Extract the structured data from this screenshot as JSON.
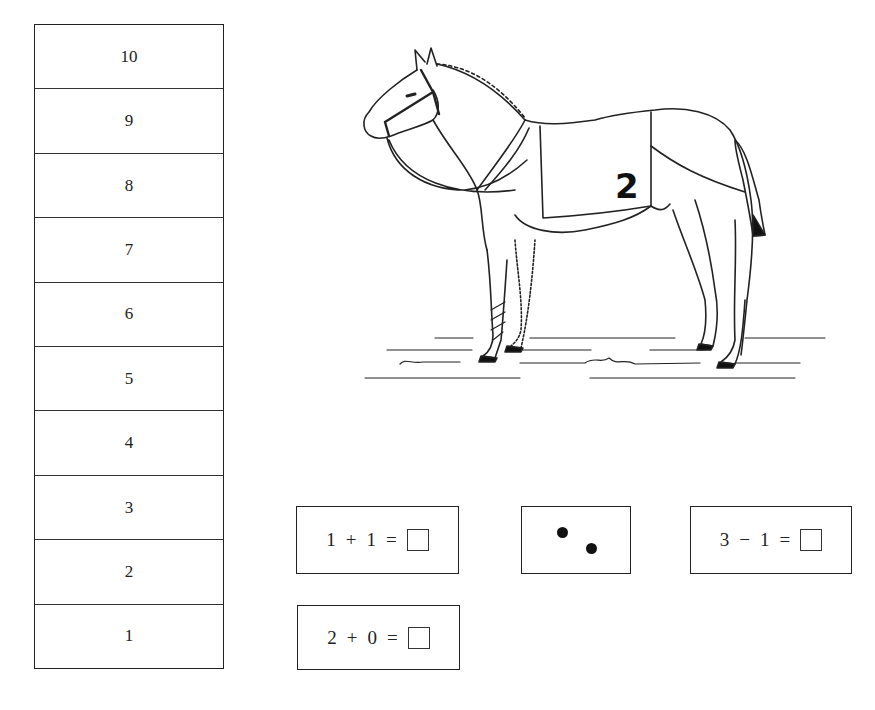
{
  "number_ladder": {
    "rungs": [
      "10",
      "9",
      "8",
      "7",
      "6",
      "5",
      "4",
      "3",
      "2",
      "1"
    ]
  },
  "illustration": {
    "subject": "horse",
    "blanket_number": "2"
  },
  "cards": {
    "eq1": {
      "left": "1",
      "op": "+",
      "right": "1",
      "equals": "="
    },
    "dots": {
      "count": 2
    },
    "eq2": {
      "left": "3",
      "op": "−",
      "right": "1",
      "equals": "="
    },
    "eq3": {
      "left": "2",
      "op": "+",
      "right": "0",
      "equals": "="
    }
  }
}
